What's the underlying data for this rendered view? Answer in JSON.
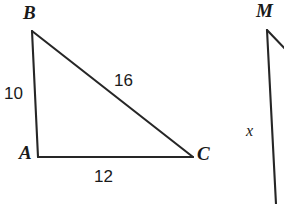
{
  "diagram": {
    "background_color": "#ffffff",
    "stroke_color": "#1a1a1a",
    "figures": [
      {
        "name": "triangle-ABC",
        "vertices": [
          {
            "label": "A",
            "x": 38,
            "y": 157
          },
          {
            "label": "B",
            "x": 32,
            "y": 31
          },
          {
            "label": "C",
            "x": 193,
            "y": 157
          }
        ],
        "sides": [
          {
            "name": "AB",
            "measure": "10"
          },
          {
            "name": "BC",
            "measure": "16"
          },
          {
            "name": "AC",
            "measure": "12"
          }
        ]
      },
      {
        "name": "partial-figure-M",
        "vertices": [
          {
            "label": "M",
            "x": 267,
            "y": 30
          }
        ],
        "sides": [
          {
            "name": "M-down",
            "measure": "x"
          }
        ]
      }
    ]
  },
  "labels": {
    "vertex_a": "A",
    "vertex_b": "B",
    "vertex_c": "C",
    "vertex_m": "M",
    "side_ab": "10",
    "side_bc": "16",
    "side_ac": "12",
    "side_mx": "x"
  }
}
